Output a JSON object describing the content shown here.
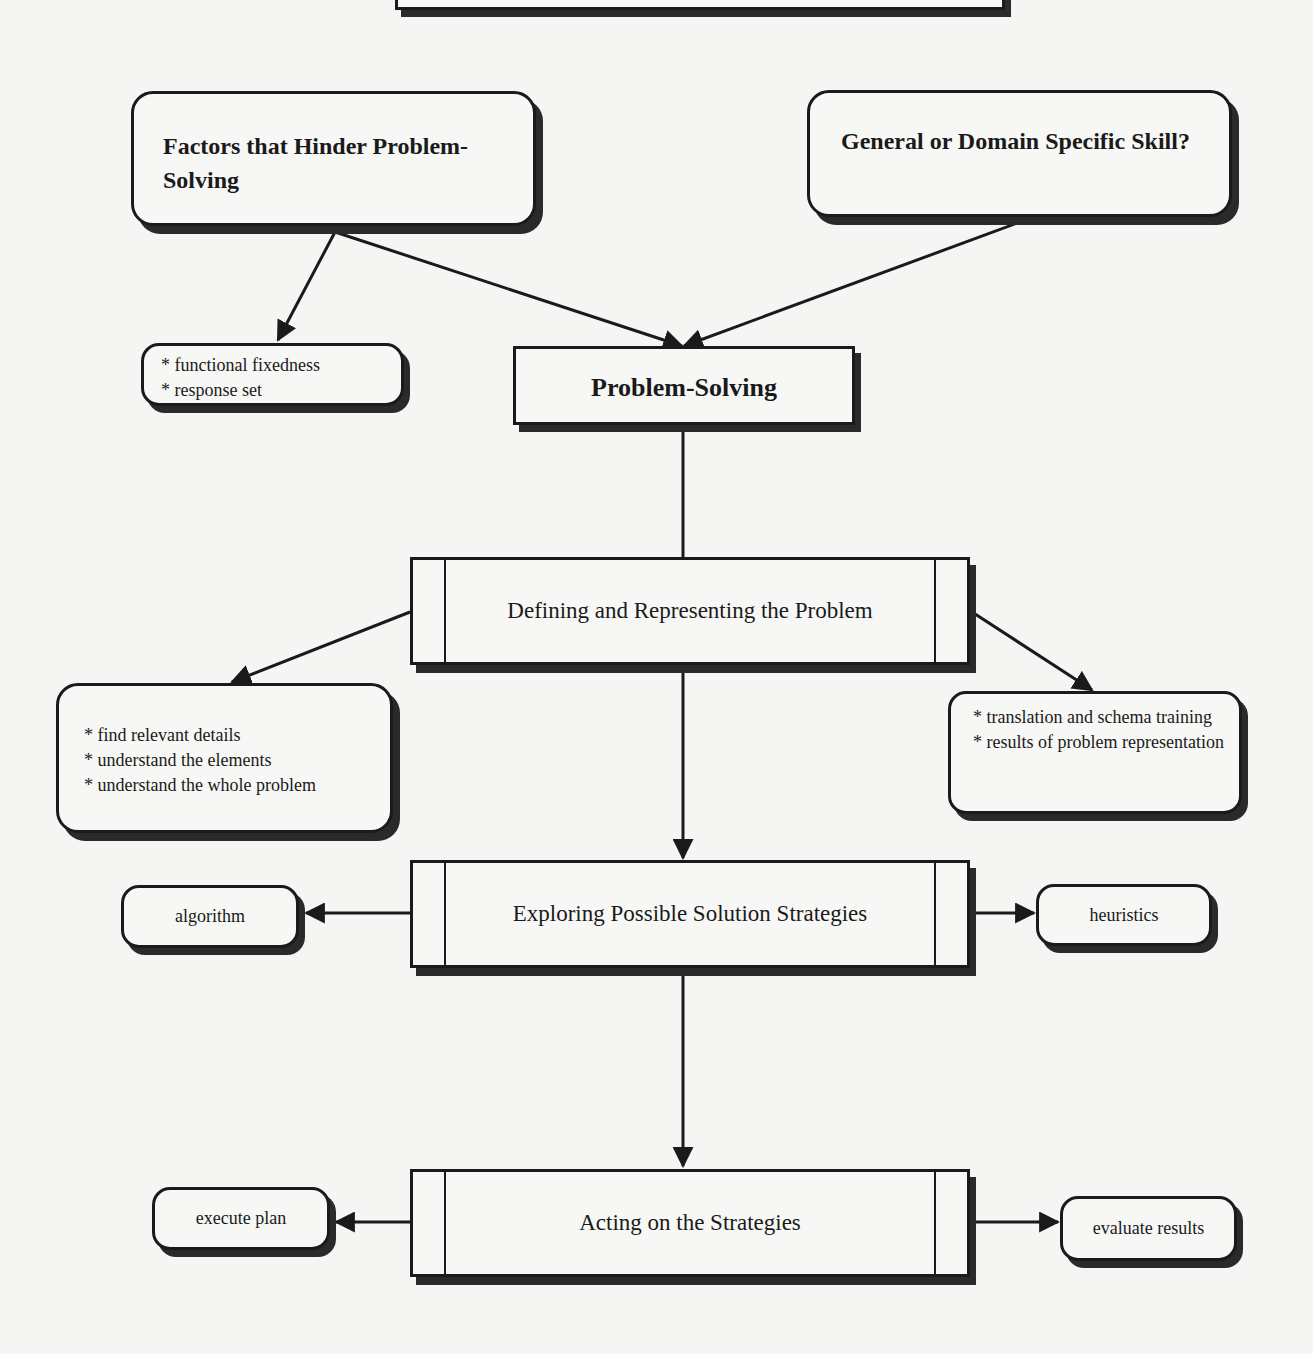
{
  "diagram": {
    "top_box_partial": {
      "label": ""
    },
    "hinder_box": {
      "title": "Factors that Hinder Problem-Solving"
    },
    "domain_box": {
      "title": "General or Domain Specific Skill?"
    },
    "hinder_list": {
      "items": [
        "* functional fixedness",
        "* response set"
      ]
    },
    "problem_solving": {
      "label": "Problem-Solving"
    },
    "defining": {
      "label": "Defining and Representing the Problem"
    },
    "defining_left_list": {
      "items": [
        "* find relevant details",
        "* understand the elements",
        "* understand the whole problem"
      ]
    },
    "defining_right_list": {
      "items": [
        "* translation and schema training",
        "* results of problem representation"
      ]
    },
    "exploring": {
      "label": "Exploring Possible Solution Strategies"
    },
    "algorithm": {
      "label": "algorithm"
    },
    "heuristics": {
      "label": "heuristics"
    },
    "acting": {
      "label": "Acting on the Strategies"
    },
    "execute_plan": {
      "label": "execute plan"
    },
    "evaluate_results": {
      "label": "evaluate results"
    }
  }
}
